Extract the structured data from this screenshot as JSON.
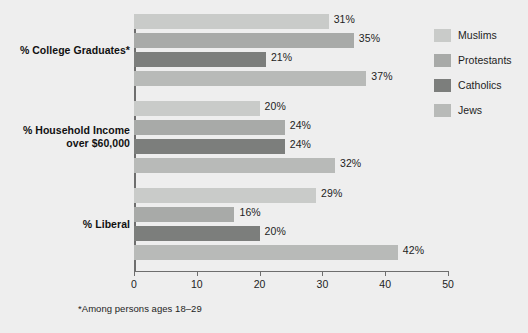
{
  "chart_data": {
    "type": "bar",
    "orientation": "horizontal",
    "title": "",
    "xlabel": "",
    "ylabel": "",
    "xlim": [
      0,
      50
    ],
    "xticks": [
      0,
      10,
      20,
      30,
      40,
      50
    ],
    "grid": false,
    "legend_position": "right",
    "categories": [
      "% College Graduates*",
      "% Household Income over $60,000",
      "% Liberal"
    ],
    "category_lines": [
      [
        "% College Graduates*"
      ],
      [
        "% Household Income",
        "over $60,000"
      ],
      [
        "% Liberal"
      ]
    ],
    "series": [
      {
        "name": "Muslims",
        "color": "#c9cbc9",
        "values": [
          31,
          20,
          29
        ],
        "labels": [
          "31%",
          "20%",
          "29%"
        ]
      },
      {
        "name": "Protestants",
        "color": "#a8aaa8",
        "values": [
          35,
          24,
          16
        ],
        "labels": [
          "35%",
          "24%",
          "16%"
        ]
      },
      {
        "name": "Catholics",
        "color": "#7c7e7c",
        "values": [
          21,
          24,
          20
        ],
        "labels": [
          "21%",
          "24%",
          "20%"
        ]
      },
      {
        "name": "Jews",
        "color": "#b8bab8",
        "values": [
          37,
          32,
          42
        ],
        "labels": [
          "37%",
          "32%",
          "42%"
        ]
      }
    ],
    "footnote": "*Among persons ages 18–29",
    "axis_color": "#6e6e6e",
    "background": "#eeeeee"
  }
}
